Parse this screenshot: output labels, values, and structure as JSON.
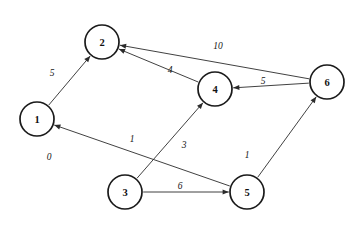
{
  "diagram": {
    "background_color": "#ffffff",
    "node_stroke_color": "#1a1a1a",
    "edge_color": "#2b2b2b",
    "nodes": [
      {
        "id": "1",
        "label": "1",
        "cx": 37,
        "cy": 119,
        "r": 17
      },
      {
        "id": "2",
        "label": "2",
        "cx": 102,
        "cy": 42,
        "r": 17
      },
      {
        "id": "3",
        "label": "3",
        "cx": 125,
        "cy": 192,
        "r": 17
      },
      {
        "id": "4",
        "label": "4",
        "cx": 215,
        "cy": 89,
        "r": 17
      },
      {
        "id": "5",
        "label": "5",
        "cx": 247,
        "cy": 192,
        "r": 17
      },
      {
        "id": "6",
        "label": "6",
        "cx": 327,
        "cy": 82,
        "r": 17
      }
    ],
    "edges": [
      {
        "from": "1",
        "to": "2",
        "weight": "5",
        "lx": 52,
        "ly": 73,
        "directed": true
      },
      {
        "from": "6",
        "to": "2",
        "weight": "10",
        "lx": 218,
        "ly": 46,
        "directed": true
      },
      {
        "from": "4",
        "to": "2",
        "weight": "4",
        "lx": 170,
        "ly": 70,
        "directed": true
      },
      {
        "from": "6",
        "to": "4",
        "weight": "5",
        "lx": 263,
        "ly": 81,
        "directed": true
      },
      {
        "from": "5",
        "to": "1",
        "weight": "1",
        "lx": 132,
        "ly": 139,
        "directed": true
      },
      {
        "from": "3",
        "to": "4",
        "weight": "3",
        "lx": 184,
        "ly": 145,
        "directed": true
      },
      {
        "from": "5",
        "to": "6",
        "weight": "1",
        "lx": 247,
        "ly": 155,
        "directed": true
      },
      {
        "from": "3",
        "to": "5",
        "weight": "6",
        "lx": 180,
        "ly": 186,
        "directed": true
      }
    ],
    "loose_labels": [
      {
        "text": "0",
        "lx": 49,
        "ly": 157
      }
    ]
  }
}
